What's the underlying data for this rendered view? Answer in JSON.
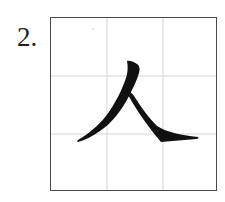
{
  "exercise": {
    "number_label": "2.",
    "character": "人",
    "grid": {
      "type": "tian-zi-ge",
      "rows": 3,
      "cols": 3,
      "border_color": "#4a4a4a",
      "line_color": "#d6d6d6"
    },
    "stroke_color": "#111111",
    "strokes": [
      "pie (left-falling)",
      "na (right-falling)"
    ]
  }
}
